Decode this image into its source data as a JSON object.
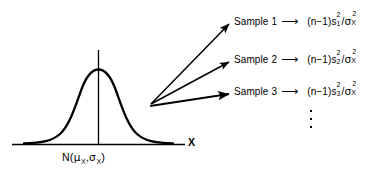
{
  "figure": {
    "axis": {
      "x_label": "X"
    },
    "distribution": {
      "label_prefix": "N",
      "open_paren": "(",
      "mean_symbol": "μ",
      "mean_subscript": "X",
      "separator": ",",
      "sd_symbol": "σ",
      "sd_subscript": "X",
      "close_paren": ")"
    },
    "arrow_glyph": "⟶",
    "samples": [
      {
        "label": "Sample 1",
        "arrow": "⟶",
        "formula": {
          "open": "(",
          "n": "n",
          "minus": "−",
          "one": "1",
          "close": ")",
          "stat_symbol": "s",
          "stat_subscript": "1",
          "stat_superscript": "2",
          "divider": "/",
          "variance_symbol": "σ",
          "variance_superscript": "2",
          "variance_subscript": "X"
        }
      },
      {
        "label": "Sample 2",
        "arrow": "⟶",
        "formula": {
          "open": "(",
          "n": "n",
          "minus": "−",
          "one": "1",
          "close": ")",
          "stat_symbol": "s",
          "stat_subscript": "2",
          "stat_superscript": "2",
          "divider": "/",
          "variance_symbol": "σ",
          "variance_superscript": "2",
          "variance_subscript": "X"
        }
      },
      {
        "label": "Sample 3",
        "arrow": "⟶",
        "formula": {
          "open": "(",
          "n": "n",
          "minus": "−",
          "one": "1",
          "close": ")",
          "stat_symbol": "s",
          "stat_subscript": "3",
          "stat_superscript": "2",
          "divider": "/",
          "variance_symbol": "σ",
          "variance_superscript": "2",
          "variance_subscript": "X"
        }
      }
    ],
    "continuation": {
      "glyph": "vertical-ellipsis",
      "dot_count": 3
    },
    "colors": {
      "ink": "#000000",
      "background": "#ffffff"
    }
  }
}
